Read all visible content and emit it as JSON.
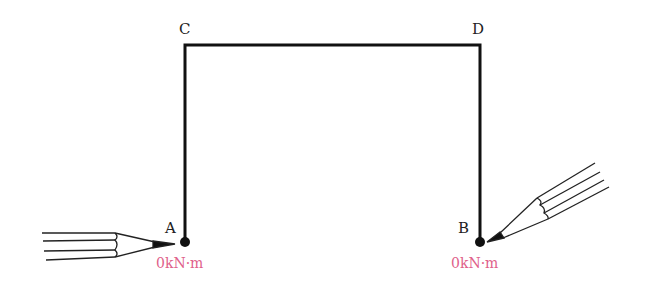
{
  "nodes": {
    "A": {
      "label": "A",
      "moment": "0kN·m"
    },
    "B": {
      "label": "B",
      "moment": "0kN·m"
    },
    "C": {
      "label": "C"
    },
    "D": {
      "label": "D"
    }
  },
  "colors": {
    "frame": "#111111",
    "moment": "#e0608a"
  }
}
